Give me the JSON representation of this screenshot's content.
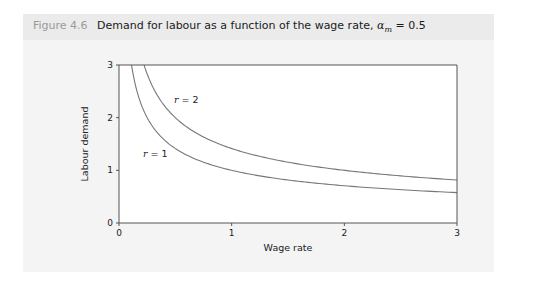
{
  "figure": {
    "number_label": "Figure 4.6",
    "title": "Demand for labour as a function of the wage rate,",
    "param_symbol": "α",
    "param_subscript": "m",
    "param_value": "= 0.5"
  },
  "colors": {
    "panel_bg": "#f4f4f4",
    "header_bg": "#ebebeb",
    "plot_bg": "#ffffff",
    "curve": "#777777",
    "axis": "#555555"
  },
  "chart_data": {
    "type": "line",
    "title": "Demand for labour as a function of the wage rate, αm = 0.5",
    "xlabel": "Wage rate",
    "ylabel": "Labour demand",
    "xlim": [
      0,
      3
    ],
    "ylim": [
      0,
      3
    ],
    "xticks": [
      "0",
      "1",
      "2",
      "3"
    ],
    "yticks": [
      "0",
      "1",
      "2",
      "3"
    ],
    "grid": false,
    "legend": "inline labels",
    "x": [
      0.111,
      0.15,
      0.2,
      0.25,
      0.3,
      0.4,
      0.5,
      0.75,
      1.0,
      1.5,
      2.0,
      2.5,
      3.0
    ],
    "series": [
      {
        "name": "r = 1",
        "label_var": "r",
        "label_val": "= 1",
        "values": [
          3.0,
          2.58,
          2.24,
          2.0,
          1.83,
          1.58,
          1.41,
          1.15,
          1.0,
          0.82,
          0.71,
          0.63,
          0.58
        ]
      },
      {
        "name": "r = 2",
        "label_var": "r",
        "label_val": "= 2",
        "values": [
          null,
          null,
          null,
          2.83,
          2.58,
          2.24,
          2.0,
          1.63,
          1.41,
          1.15,
          1.0,
          0.89,
          0.82
        ]
      }
    ]
  }
}
